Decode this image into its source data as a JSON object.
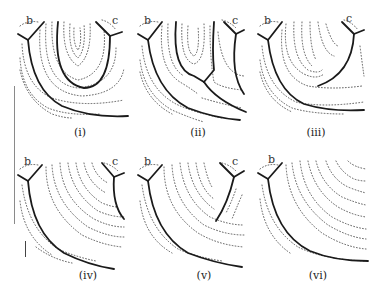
{
  "figure": {
    "panels": [
      {
        "id": "i",
        "caption": "(i)",
        "corner_labels": {
          "left": "b",
          "right": "c"
        }
      },
      {
        "id": "ii",
        "caption": "(ii)",
        "corner_labels": {
          "left": "b",
          "right": "c"
        }
      },
      {
        "id": "iii",
        "caption": "(iii)",
        "corner_labels": {
          "left": "b",
          "right": "c"
        }
      },
      {
        "id": "iv",
        "caption": "(iv)",
        "corner_labels": {
          "left": "b",
          "right": "c"
        }
      },
      {
        "id": "v",
        "caption": "(v)",
        "corner_labels": {
          "left": "b",
          "right": "c"
        }
      },
      {
        "id": "vi",
        "caption": "(vi)",
        "corner_labels": {
          "left": "b"
        }
      }
    ],
    "colors": {
      "solid_line": "#1a1a1a",
      "dotted_line": "#555555",
      "background": "#ffffff"
    }
  }
}
